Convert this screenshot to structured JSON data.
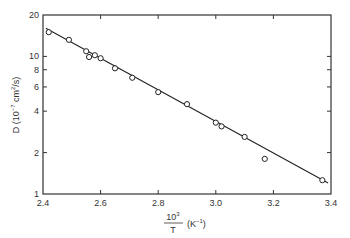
{
  "chart_data": {
    "type": "scatter",
    "title": "",
    "xlabel": "10^3 / T (K^-1)",
    "xlabel_numerator": "10",
    "xlabel_exp": "3",
    "xlabel_denominator": "T",
    "xlabel_units": "(K",
    "xlabel_units_exp": "−1",
    "xlabel_units_close": ")",
    "ylabel": "D (10^-7 cm^2/s)",
    "ylabel_prefix": "D (10",
    "ylabel_exp": "−7",
    "ylabel_mid": " cm",
    "ylabel_exp2": "2",
    "ylabel_suffix": "/s)",
    "xlim": [
      2.4,
      3.4
    ],
    "ylim": [
      1,
      20
    ],
    "yscale": "log",
    "grid": false,
    "legend": null,
    "x_ticks": [
      2.4,
      2.6,
      2.8,
      3.0,
      3.2,
      3.4
    ],
    "x_tick_labels": [
      "2.4",
      "2.6",
      "2.8",
      "3.0",
      "3.2",
      "3.4"
    ],
    "y_ticks": [
      1,
      2,
      4,
      6,
      8,
      10,
      20
    ],
    "y_tick_labels": [
      "1",
      "2",
      "4",
      "6",
      "8",
      "10",
      "20"
    ],
    "series": [
      {
        "name": "measured",
        "marker": "open-circle",
        "x": [
          2.42,
          2.49,
          2.55,
          2.56,
          2.58,
          2.6,
          2.65,
          2.71,
          2.8,
          2.9,
          3.0,
          3.02,
          3.1,
          3.17,
          3.37
        ],
        "y": [
          15.0,
          13.2,
          10.9,
          9.9,
          10.2,
          9.7,
          8.2,
          7.0,
          5.5,
          4.5,
          3.3,
          3.1,
          2.6,
          1.8,
          1.26
        ]
      },
      {
        "name": "fit",
        "type": "line",
        "x": [
          2.41,
          3.39
        ],
        "y": [
          16.0,
          1.2
        ]
      }
    ]
  }
}
